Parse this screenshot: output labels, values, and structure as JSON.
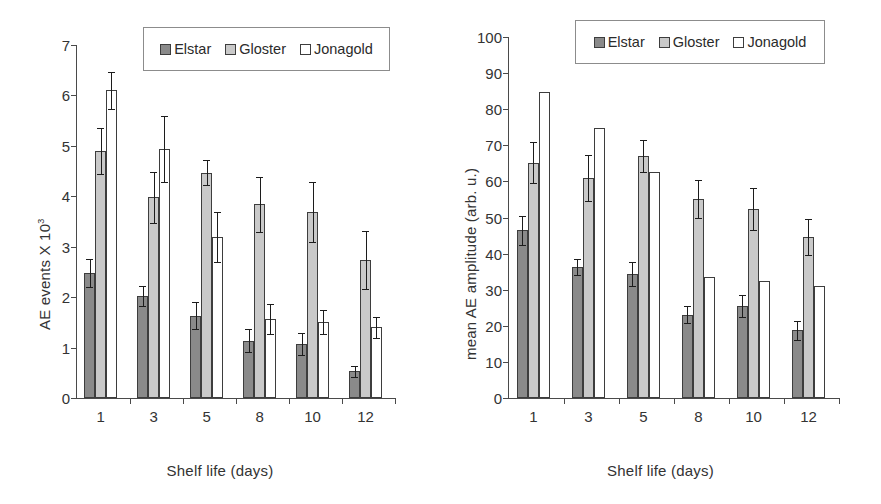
{
  "figure": {
    "background": "#ffffff",
    "series_colors": [
      "#8a8a8a",
      "#c9c9c9",
      "#ffffff"
    ]
  },
  "chart_data": [
    {
      "panel": "left",
      "type": "bar",
      "title": "",
      "xlabel": "Shelf life (days)",
      "ylabel_main": "AE events  X 10",
      "ylabel_exp": "3",
      "ylabel": "AE events X 10^3",
      "categories": [
        "1",
        "3",
        "5",
        "8",
        "10",
        "12"
      ],
      "xlim": [
        0,
        6
      ],
      "ylim": [
        0,
        7
      ],
      "yticks": [
        "0",
        "1",
        "2",
        "3",
        "4",
        "5",
        "6",
        "7"
      ],
      "ytick_values": [
        0,
        1,
        2,
        3,
        4,
        5,
        6,
        7
      ],
      "grid": false,
      "legend_position": "top-center",
      "series": [
        {
          "name": "Elstar",
          "color": "#8a8a8a",
          "values": [
            2.48,
            2.03,
            1.63,
            1.14,
            1.07,
            0.53
          ],
          "errors": [
            0.27,
            0.2,
            0.27,
            0.23,
            0.21,
            0.11
          ]
        },
        {
          "name": "Gloster",
          "color": "#c9c9c9",
          "values": [
            4.9,
            3.98,
            4.47,
            3.84,
            3.69,
            2.74
          ],
          "errors": [
            0.46,
            0.5,
            0.25,
            0.55,
            0.59,
            0.58
          ]
        },
        {
          "name": "Jonagold",
          "color": "#ffffff",
          "values": [
            6.1,
            4.94,
            3.19,
            1.56,
            1.51,
            1.4
          ],
          "errors": [
            0.37,
            0.65,
            0.5,
            0.3,
            0.24,
            0.21
          ]
        }
      ]
    },
    {
      "panel": "right",
      "type": "bar",
      "title": "",
      "xlabel": "Shelf life  (days)",
      "ylabel": "mean AE amplitude (arb. u.)",
      "categories": [
        "1",
        "3",
        "5",
        "8",
        "10",
        "12"
      ],
      "xlim": [
        0,
        6
      ],
      "ylim": [
        0,
        100
      ],
      "yticks": [
        "0",
        "10",
        "20",
        "30",
        "40",
        "50",
        "60",
        "70",
        "80",
        "90",
        "100"
      ],
      "ytick_values": [
        0,
        10,
        20,
        30,
        40,
        50,
        60,
        70,
        80,
        90,
        100
      ],
      "grid": false,
      "legend_position": "top-center",
      "series": [
        {
          "name": "Elstar",
          "color": "#8a8a8a",
          "values": [
            46.5,
            36.3,
            34.4,
            23.1,
            25.4,
            18.8
          ],
          "errors": [
            4.0,
            2.2,
            3.4,
            2.4,
            3.0,
            2.6
          ]
        },
        {
          "name": "Gloster",
          "color": "#c9c9c9",
          "values": [
            65.2,
            61.0,
            67.0,
            55.1,
            52.3,
            44.6
          ],
          "errors": [
            5.7,
            6.3,
            4.4,
            5.2,
            5.9,
            5.0
          ]
        },
        {
          "name": "Jonagold",
          "color": "#ffffff",
          "values": [
            84.7,
            74.7,
            62.5,
            33.6,
            32.4,
            31.0
          ]
        }
      ]
    }
  ],
  "legend": {
    "items": [
      {
        "label": "Elstar",
        "swatch": "s0"
      },
      {
        "label": "Gloster",
        "swatch": "s1"
      },
      {
        "label": "Jonagold",
        "swatch": "s2"
      }
    ]
  }
}
